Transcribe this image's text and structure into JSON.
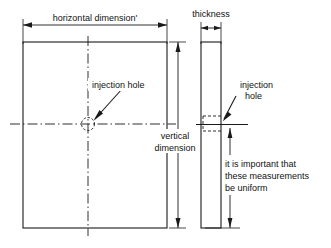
{
  "diagram": {
    "line_color": "#1a1a1a",
    "background": "#ffffff",
    "labels": {
      "horizontal_dimension": "horizontal dimension'",
      "thickness": "thickness",
      "injection_hole_front": "injection hole",
      "injection_hole_side_line1": "injection",
      "injection_hole_side_line2": "hole",
      "vertical_dimension_line1": "vertical",
      "vertical_dimension_line2": "dimension",
      "note_line1": "it is important that",
      "note_line2": "these measurements",
      "note_line3": "be uniform"
    },
    "views": [
      {
        "name": "front-view",
        "shape": "rectangle",
        "x": 23,
        "y": 42,
        "width": 144,
        "height": 186
      },
      {
        "name": "side-view",
        "shape": "rectangle",
        "x": 201,
        "y": 42,
        "width": 20,
        "height": 186
      }
    ],
    "dimensions": [
      {
        "name": "horizontal-dimension",
        "orientation": "horizontal",
        "from": 23,
        "to": 167,
        "at": 25
      },
      {
        "name": "thickness-dimension",
        "orientation": "horizontal",
        "from": 201,
        "to": 221,
        "at": 28
      },
      {
        "name": "vertical-dimension",
        "orientation": "vertical",
        "from": 42,
        "to": 228,
        "at": 178
      },
      {
        "name": "uniform-measurement-dimension",
        "orientation": "vertical",
        "from": 128,
        "to": 228,
        "at": 230
      }
    ],
    "features": [
      {
        "name": "injection-hole-front",
        "shape": "circle",
        "cx": 88,
        "cy": 124,
        "r": 6.5
      }
    ]
  }
}
